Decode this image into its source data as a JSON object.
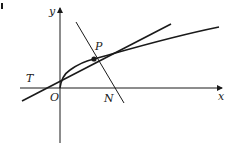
{
  "diagram": {
    "type": "coordinate-geometry",
    "labels": {
      "y_axis": "y",
      "x_axis": "x",
      "origin": "O",
      "point_p": "P",
      "tangent_point": "T",
      "normal_point": "N"
    },
    "colors": {
      "stroke": "#1a1a1a",
      "background": "#ffffff"
    },
    "geometry": {
      "origin": [
        60,
        88
      ],
      "P": [
        94,
        59
      ],
      "N": [
        114,
        88
      ],
      "curve": [
        [
          60,
          88
        ],
        [
          63,
          78
        ],
        [
          70,
          70
        ],
        [
          80,
          64
        ],
        [
          94,
          59
        ],
        [
          120,
          52
        ],
        [
          160,
          40
        ],
        [
          219,
          27
        ]
      ],
      "tangent": [
        [
          22,
          101
        ],
        [
          171,
          24
        ]
      ],
      "normal": [
        [
          76,
          22
        ],
        [
          124,
          103
        ]
      ],
      "x_axis": [
        [
          20,
          88
        ],
        [
          222,
          88
        ]
      ],
      "y_axis": [
        [
          60,
          143
        ],
        [
          60,
          8
        ]
      ]
    }
  }
}
